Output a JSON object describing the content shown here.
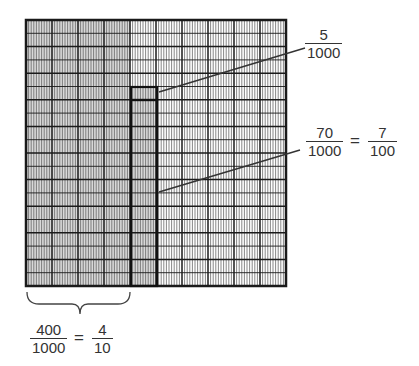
{
  "diagram": {
    "grid": {
      "major_columns": 10,
      "major_rows": 10,
      "minor_vertical_per_column": 10,
      "minor_horizontal_per_row": 2,
      "shaded_full_columns": 4,
      "shaded_partial_column_index": 4,
      "shaded_partial_start_row_fraction": 0.25,
      "colors": {
        "shade": "#d9d9d9",
        "line_major": "#1a1a1a",
        "line_minor": "#555555",
        "background": "#ffffff"
      }
    },
    "labels": {
      "small_box": {
        "numerator": "5",
        "denominator": "1000"
      },
      "tall_box": {
        "numerator": "70",
        "denominator": "1000",
        "equals": "=",
        "eq_numerator": "7",
        "eq_denominator": "100"
      },
      "shaded_columns": {
        "numerator": "400",
        "denominator": "1000",
        "equals": "=",
        "eq_numerator": "4",
        "eq_denominator": "10"
      }
    }
  }
}
